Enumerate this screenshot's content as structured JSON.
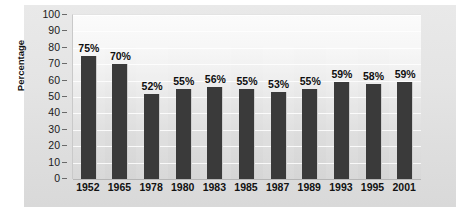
{
  "chart_data": {
    "type": "bar",
    "title": "",
    "xlabel": "",
    "ylabel": "Percentage",
    "ylim": [
      0,
      100
    ],
    "ytick_step": 10,
    "yticks": [
      100,
      90,
      80,
      70,
      60,
      50,
      40,
      30,
      20,
      10,
      0
    ],
    "grid": true,
    "legend": "none",
    "bar_color": "#3a3a3a",
    "plot_background": "#ececec",
    "panel_background": "#e2e2e2",
    "categories": [
      "1952",
      "1965",
      "1978",
      "1980",
      "1983",
      "1985",
      "1987",
      "1989",
      "1993",
      "1995",
      "2001"
    ],
    "values": [
      75,
      70,
      52,
      55,
      56,
      55,
      53,
      55,
      59,
      58,
      59
    ],
    "data_labels": [
      "75%",
      "70%",
      "52%",
      "55%",
      "56%",
      "55%",
      "53%",
      "55%",
      "59%",
      "58%",
      "59%"
    ]
  }
}
